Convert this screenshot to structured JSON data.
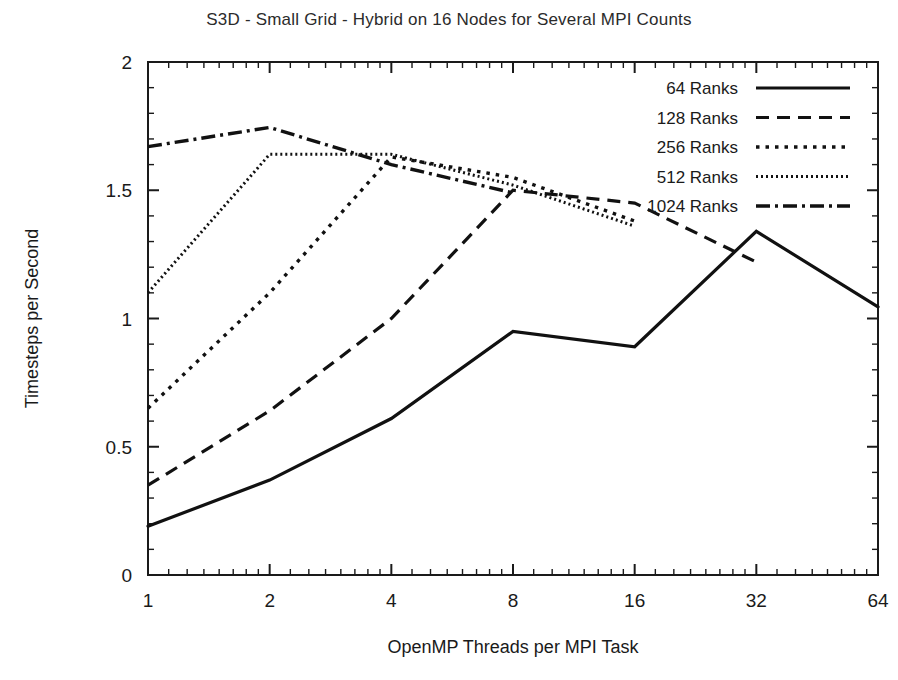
{
  "chart_data": {
    "type": "line",
    "title": "S3D - Small Grid - Hybrid on 16 Nodes for Several MPI Counts",
    "xlabel": "OpenMP Threads per MPI Task",
    "ylabel": "Timesteps per Second",
    "x_scale": "log2",
    "xlim": [
      1,
      64
    ],
    "ylim": [
      0,
      2
    ],
    "xticks": [
      1,
      2,
      4,
      8,
      16,
      32,
      64
    ],
    "xtick_labels": [
      "1",
      "2",
      "4",
      "8",
      "16",
      "32",
      "64"
    ],
    "yticks": [
      0,
      0.5,
      1,
      1.5,
      2
    ],
    "ytick_labels": [
      "0",
      "0.5",
      "1",
      "1.5",
      "2"
    ],
    "minor_ticks": true,
    "grid": false,
    "legend_position": "top-right",
    "series": [
      {
        "name": "64 Ranks",
        "style": "solid",
        "dash": "none",
        "color": "#111111",
        "width": 3.2,
        "x": [
          1,
          2,
          4,
          8,
          16,
          32,
          64
        ],
        "values": [
          0.19,
          0.37,
          0.61,
          0.95,
          0.89,
          1.34,
          1.045
        ]
      },
      {
        "name": "128 Ranks",
        "style": "dashed",
        "dash": "13,8",
        "color": "#111111",
        "width": 3.2,
        "x": [
          1,
          2,
          4,
          8,
          16,
          32
        ],
        "values": [
          0.35,
          0.64,
          1.0,
          1.5,
          1.45,
          1.22
        ]
      },
      {
        "name": "256 Ranks",
        "style": "dotted-medium",
        "dash": "3.5,6",
        "color": "#111111",
        "width": 3.4,
        "x": [
          1,
          2,
          4,
          8,
          16
        ],
        "values": [
          0.65,
          1.1,
          1.63,
          1.55,
          1.38
        ]
      },
      {
        "name": "512 Ranks",
        "style": "dotted-fine",
        "dash": "2,3",
        "color": "#111111",
        "width": 3.0,
        "x": [
          1,
          2,
          4,
          8,
          16
        ],
        "values": [
          1.1,
          1.64,
          1.64,
          1.52,
          1.36
        ]
      },
      {
        "name": "1024 Ranks",
        "style": "dash-dot",
        "dash": "14,5,3,5",
        "color": "#111111",
        "width": 3.4,
        "x": [
          1,
          2,
          4,
          8
        ],
        "values": [
          1.67,
          1.745,
          1.6,
          1.49
        ]
      }
    ]
  },
  "legend": {
    "entries": [
      {
        "label": "64 Ranks"
      },
      {
        "label": "128 Ranks"
      },
      {
        "label": "256 Ranks"
      },
      {
        "label": "512 Ranks"
      },
      {
        "label": "1024 Ranks"
      }
    ]
  }
}
